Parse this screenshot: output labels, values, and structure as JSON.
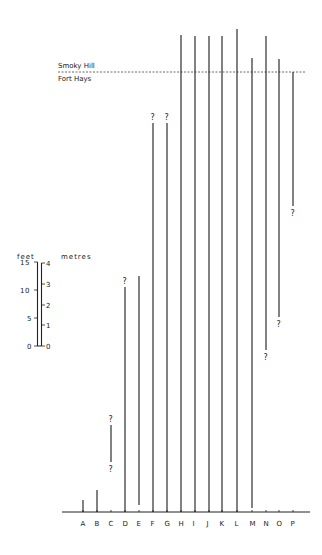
{
  "formations": {
    "upper": "Smoky Hill",
    "lower": "Fort Hays",
    "contact_y": 72
  },
  "scale": {
    "feet_label": "feet",
    "metres_label": "metres",
    "feet_ticks": [
      "0",
      "5",
      "10",
      "15"
    ],
    "metres_ticks": [
      "0",
      "1",
      "2",
      "3",
      "4"
    ]
  },
  "baseline_y": 512,
  "columns": [
    {
      "label": "A",
      "x": 83,
      "top": 500,
      "bottom": 512,
      "q_top": false,
      "q_bottom": false
    },
    {
      "label": "B",
      "x": 97,
      "top": 490,
      "bottom": 512,
      "q_top": false,
      "q_bottom": false
    },
    {
      "label": "C",
      "x": 111,
      "top": 425,
      "bottom": 462,
      "q_top": true,
      "q_bottom": true
    },
    {
      "label": "D",
      "x": 125,
      "top": 287,
      "bottom": 512,
      "q_top": true,
      "q_bottom": false
    },
    {
      "label": "E",
      "x": 139,
      "top": 276,
      "bottom": 505,
      "q_top": false,
      "q_bottom": false
    },
    {
      "label": "F",
      "x": 153,
      "top": 123,
      "bottom": 512,
      "q_top": true,
      "q_bottom": false
    },
    {
      "label": "G",
      "x": 167,
      "top": 123,
      "bottom": 512,
      "q_top": true,
      "q_bottom": false
    },
    {
      "label": "H",
      "x": 181,
      "top": 35,
      "bottom": 512,
      "q_top": false,
      "q_bottom": false
    },
    {
      "label": "I",
      "x": 195,
      "top": 36,
      "bottom": 512,
      "q_top": false,
      "q_bottom": false
    },
    {
      "label": "J",
      "x": 209,
      "top": 36,
      "bottom": 512,
      "q_top": false,
      "q_bottom": false
    },
    {
      "label": "K",
      "x": 222,
      "top": 36,
      "bottom": 512,
      "q_top": false,
      "q_bottom": false
    },
    {
      "label": "L",
      "x": 237,
      "top": 29,
      "bottom": 512,
      "q_top": false,
      "q_bottom": false
    },
    {
      "label": "M",
      "x": 252,
      "top": 58,
      "bottom": 508,
      "q_top": false,
      "q_bottom": false
    },
    {
      "label": "N",
      "x": 266,
      "top": 36,
      "bottom": 350,
      "q_top": false,
      "q_bottom": true
    },
    {
      "label": "O",
      "x": 279,
      "top": 59,
      "bottom": 317,
      "q_top": false,
      "q_bottom": true
    },
    {
      "label": "P",
      "x": 293,
      "top": 72,
      "bottom": 206,
      "q_top": false,
      "q_bottom": true
    }
  ]
}
